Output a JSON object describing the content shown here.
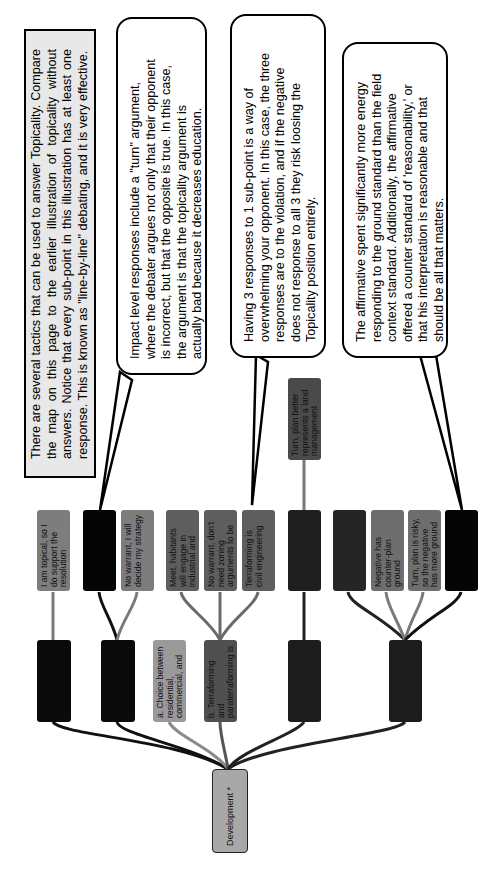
{
  "notes": {
    "intro": "There are several tactics that can be used to answer Topicality. Compare the map on this page to the earlier illustration of topicality without answers. Notice that every sub-point in this illustration has at least one response. This is known as \"line-by-line\" debating, and it is very effective.",
    "callout_impact": "Impact level responses include a \"turn\" argument, where the debater argues not only that their opponent is incorrect, but that the opposite is true. In this case, the argument is that the topicality argument is actually bad because it decreases education.",
    "callout_three_responses": "Having 3 responses to 1 sub-point is a way of overwhelming your opponent. In this case, the three responses are to the violation, and if the negative does not response to all 3 they risk loosing the Topicality position entirely.",
    "callout_ground": "The affirmative spent significantly more energy responding to the ground standard than the field context standard. Additionally, the affirmative offered a counter standard of 'reasonability,' or that his interpretation is reasonable and that should be all that matters."
  },
  "tree": {
    "root": {
      "label": "Development *",
      "color": "#a8a8a8"
    },
    "level1": [
      {
        "id": "n1",
        "label": "",
        "color": "#0a0a0a"
      },
      {
        "id": "n2",
        "label": "",
        "color": "#0a0a0a"
      },
      {
        "id": "n3",
        "label": "a. Choice between residential, commercial, and",
        "color": "#9a9a9a"
      },
      {
        "id": "n4",
        "label": "b. Terraforming and paraterraforming is",
        "color": "#505050"
      },
      {
        "id": "n5",
        "label": "",
        "color": "#1c1c1c"
      },
      {
        "id": "n6",
        "label": "",
        "color": "#1c1c1c"
      }
    ],
    "level2": [
      {
        "parent": "n1",
        "label": "I am topical, so I do support the resolution",
        "color": "#7d7d7d"
      },
      {
        "parent": "n2",
        "label": "",
        "color": "#050505"
      },
      {
        "parent": "n2",
        "label": "No warrant, I will decide my strategy",
        "color": "#7d7d7d"
      },
      {
        "parent": "n4",
        "label": "Meet, habitants will engage in industrial and",
        "color": "#5e5e5e"
      },
      {
        "parent": "n4",
        "label": "No warrant, don't need zoning arguments to be",
        "color": "#5e5e5e"
      },
      {
        "parent": "n4",
        "label": "Terraforming is civil engineering",
        "color": "#5e5e5e"
      },
      {
        "parent": "n5",
        "label": "",
        "color": "#1e1e1e"
      },
      {
        "parent": "n6",
        "label": "",
        "color": "#252525"
      },
      {
        "parent": "n6",
        "label": "Negative has counter-plan ground",
        "color": "#6e6e6e"
      },
      {
        "parent": "n6",
        "label": "Turn, plan is risky, so the negative has more ground",
        "color": "#6e6e6e"
      },
      {
        "parent": "n6",
        "label": "",
        "color": "#050505"
      }
    ],
    "level3": [
      {
        "parent": "level2.6",
        "label": "Turn, plan better represents a land management",
        "color": "#4a4a4a"
      }
    ]
  },
  "colors": {
    "note_gray_bg": "#e8e8e8",
    "line_dark": "#111111",
    "line_gray": "#7a7a7a"
  }
}
